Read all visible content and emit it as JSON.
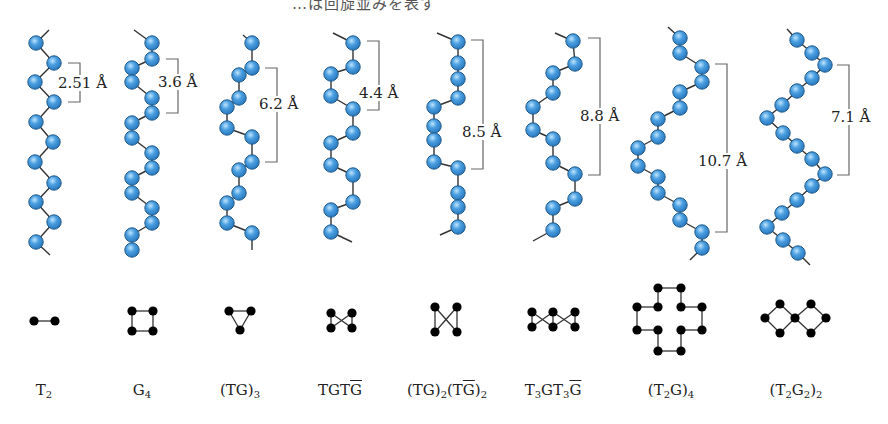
{
  "header": {
    "caption_fragment": "…は回旋並みを表す"
  },
  "colors": {
    "atom_fill": "#4a9fe0",
    "atom_stroke": "#1f5a8a",
    "bond": "#333333",
    "projection": "#000000",
    "bracket": "#666666"
  },
  "chains": [
    {
      "id": "T2",
      "label_html": "T<sub>2</sub>",
      "label_x": 44,
      "repeat_distance": "2.51 Å",
      "atoms": [
        [
          36,
          43
        ],
        [
          54,
          63
        ],
        [
          35,
          82
        ],
        [
          54,
          102
        ],
        [
          36,
          122
        ],
        [
          53,
          142
        ],
        [
          35,
          162
        ],
        [
          54,
          183
        ],
        [
          36,
          202
        ],
        [
          54,
          222
        ],
        [
          36,
          242
        ]
      ],
      "ends": [
        [
          49,
          30
        ],
        [
          50,
          255
        ]
      ],
      "bracket": {
        "x": 80,
        "y1": 63,
        "y2": 102,
        "label_x": 57,
        "label_y": 75
      },
      "projection": {
        "nodes": [
          [
            34,
            321
          ],
          [
            55,
            321
          ]
        ],
        "edges": [
          [
            0,
            1
          ]
        ]
      }
    },
    {
      "id": "G4",
      "label_html": "G<sub>4</sub>",
      "label_x": 142,
      "repeat_distance": "3.6 Å",
      "atoms": [
        [
          152,
          43
        ],
        [
          152,
          59
        ],
        [
          132,
          68
        ],
        [
          132,
          82
        ],
        [
          152,
          98
        ],
        [
          152,
          113
        ],
        [
          132,
          123
        ],
        [
          132,
          138
        ],
        [
          152,
          153
        ],
        [
          152,
          168
        ],
        [
          132,
          178
        ],
        [
          132,
          193
        ],
        [
          152,
          208
        ],
        [
          152,
          223
        ],
        [
          132,
          235
        ],
        [
          132,
          250
        ]
      ],
      "ends": [
        [
          134,
          30
        ],
        null
      ],
      "bracket": {
        "x": 178,
        "y1": 59,
        "y2": 113,
        "label_x": 157,
        "label_y": 74
      },
      "projection": {
        "nodes": [
          [
            132,
            311
          ],
          [
            153,
            311
          ],
          [
            132,
            331
          ],
          [
            153,
            331
          ]
        ],
        "edges": [
          [
            0,
            1
          ],
          [
            1,
            3
          ],
          [
            3,
            2
          ],
          [
            2,
            0
          ]
        ]
      }
    },
    {
      "id": "(TG)3",
      "label_html": "(TG)<sub>3</sub>",
      "label_x": 240,
      "repeat_distance": "6.2 Å",
      "atoms": [
        [
          252,
          43
        ],
        [
          252,
          68
        ],
        [
          239,
          75
        ],
        [
          239,
          98
        ],
        [
          227,
          107
        ],
        [
          227,
          128
        ],
        [
          252,
          137
        ],
        [
          252,
          162
        ],
        [
          239,
          170
        ],
        [
          239,
          193
        ],
        [
          227,
          203
        ],
        [
          227,
          223
        ],
        [
          252,
          233
        ]
      ],
      "ends": [
        [
          243,
          35
        ],
        [
          252,
          250
        ]
      ],
      "bracket": {
        "x": 277,
        "y1": 68,
        "y2": 162,
        "label_x": 258,
        "label_y": 96
      },
      "projection": {
        "nodes": [
          [
            229,
            311
          ],
          [
            251,
            311
          ],
          [
            240,
            330
          ]
        ],
        "edges": [
          [
            0,
            1
          ],
          [
            1,
            2
          ],
          [
            2,
            0
          ]
        ]
      }
    },
    {
      "id": "TGTG-bar",
      "label_html": "TGT<span class=\"ov\">G</span>",
      "label_x": 340,
      "repeat_distance": "4.4 Å",
      "atoms": [
        [
          353,
          43
        ],
        [
          353,
          67
        ],
        [
          331,
          74
        ],
        [
          331,
          96
        ],
        [
          353,
          109
        ],
        [
          353,
          133
        ],
        [
          331,
          143
        ],
        [
          331,
          165
        ],
        [
          353,
          175
        ],
        [
          353,
          202
        ],
        [
          331,
          210
        ],
        [
          331,
          232
        ]
      ],
      "ends": [
        [
          333,
          33
        ],
        [
          352,
          242
        ]
      ],
      "bracket": {
        "x": 379,
        "y1": 41,
        "y2": 110,
        "label_x": 358,
        "label_y": 85
      },
      "projection": {
        "nodes": [
          [
            331,
            313
          ],
          [
            352,
            313
          ],
          [
            331,
            328
          ],
          [
            352,
            328
          ]
        ],
        "edges": [
          [
            0,
            3
          ],
          [
            1,
            2
          ],
          [
            0,
            2
          ],
          [
            1,
            3
          ]
        ]
      }
    },
    {
      "id": "(TG)2(TG-bar)2",
      "label_html": "(TG)<sub>2</sub>(T<span class=\"ov\">G</span>)<sub>2</sub>",
      "label_x": 447,
      "repeat_distance": "8.5 Å",
      "atoms": [
        [
          458,
          42
        ],
        [
          458,
          63
        ],
        [
          458,
          79
        ],
        [
          458,
          98
        ],
        [
          434,
          107
        ],
        [
          434,
          126
        ],
        [
          434,
          140
        ],
        [
          434,
          162
        ],
        [
          458,
          168
        ],
        [
          458,
          193
        ],
        [
          458,
          207
        ],
        [
          458,
          227
        ]
      ],
      "ends": [
        [
          437,
          33
        ],
        [
          440,
          235
        ]
      ],
      "bracket": {
        "x": 483,
        "y1": 40,
        "y2": 169,
        "label_x": 461,
        "label_y": 124
      },
      "projection": {
        "nodes": [
          [
            435,
            307
          ],
          [
            457,
            307
          ],
          [
            435,
            332
          ],
          [
            457,
            332
          ]
        ],
        "edges": [
          [
            0,
            2
          ],
          [
            1,
            3
          ],
          [
            0,
            3
          ],
          [
            1,
            2
          ]
        ]
      }
    },
    {
      "id": "T3GT3G-bar",
      "label_html": "T<sub>3</sub>GT<sub>3</sub><span class=\"ov\">G</span>",
      "label_x": 553,
      "repeat_distance": "8.8 Å",
      "atoms": [
        [
          573,
          41
        ],
        [
          575,
          64
        ],
        [
          553,
          73
        ],
        [
          553,
          93
        ],
        [
          533,
          107
        ],
        [
          533,
          130
        ],
        [
          553,
          139
        ],
        [
          553,
          163
        ],
        [
          575,
          174
        ],
        [
          575,
          199
        ],
        [
          553,
          208
        ],
        [
          553,
          230
        ]
      ],
      "ends": [
        [
          555,
          33
        ],
        [
          533,
          241
        ]
      ],
      "bracket": {
        "x": 600,
        "y1": 38,
        "y2": 175,
        "label_x": 579,
        "label_y": 108
      },
      "projection": {
        "nodes": [
          [
            532,
            312
          ],
          [
            553,
            312
          ],
          [
            575,
            312
          ],
          [
            532,
            327
          ],
          [
            553,
            327
          ],
          [
            575,
            327
          ]
        ],
        "edges": [
          [
            0,
            3
          ],
          [
            1,
            4
          ],
          [
            2,
            5
          ],
          [
            0,
            4
          ],
          [
            3,
            1
          ],
          [
            1,
            5
          ],
          [
            4,
            2
          ]
        ]
      }
    },
    {
      "id": "(T2G)4",
      "label_html": "(T<sub>2</sub>G)<sub>4</sub>",
      "label_x": 671,
      "repeat_distance": "10.7 Å",
      "atoms": [
        [
          680,
          38
        ],
        [
          680,
          53
        ],
        [
          702,
          67
        ],
        [
          702,
          82
        ],
        [
          680,
          92
        ],
        [
          680,
          108
        ],
        [
          658,
          119
        ],
        [
          658,
          137
        ],
        [
          638,
          148
        ],
        [
          638,
          166
        ],
        [
          658,
          177
        ],
        [
          658,
          193
        ],
        [
          680,
          205
        ],
        [
          680,
          220
        ],
        [
          702,
          232
        ],
        [
          702,
          248
        ]
      ],
      "ends": [
        [
          668,
          27
        ],
        [
          690,
          260
        ]
      ],
      "bracket": {
        "x": 727,
        "y1": 64,
        "y2": 232,
        "label_x": 697,
        "label_y": 153
      },
      "projection": {
        "nodes": [
          [
            658,
            288
          ],
          [
            681,
            288
          ],
          [
            637,
            307
          ],
          [
            658,
            307
          ],
          [
            681,
            307
          ],
          [
            702,
            307
          ],
          [
            637,
            330
          ],
          [
            658,
            330
          ],
          [
            681,
            330
          ],
          [
            702,
            330
          ],
          [
            658,
            351
          ],
          [
            681,
            351
          ]
        ],
        "edges": [
          [
            0,
            1
          ],
          [
            0,
            3
          ],
          [
            1,
            4
          ],
          [
            3,
            2
          ],
          [
            4,
            5
          ],
          [
            2,
            6
          ],
          [
            5,
            9
          ],
          [
            6,
            7
          ],
          [
            8,
            9
          ],
          [
            7,
            10
          ],
          [
            8,
            11
          ],
          [
            10,
            11
          ]
        ]
      }
    },
    {
      "id": "(T2G2)2",
      "label_html": "(T<sub>2</sub>G<sub>2</sub>)<sub>2</sub>",
      "label_x": 796,
      "repeat_distance": "7.1 Å",
      "atoms": [
        [
          797,
          40
        ],
        [
          812,
          53
        ],
        [
          825,
          65
        ],
        [
          812,
          78
        ],
        [
          797,
          91
        ],
        [
          782,
          105
        ],
        [
          767,
          118
        ],
        [
          783,
          133
        ],
        [
          797,
          146
        ],
        [
          812,
          159
        ],
        [
          825,
          174
        ],
        [
          812,
          186
        ],
        [
          797,
          200
        ],
        [
          782,
          213
        ],
        [
          767,
          227
        ],
        [
          783,
          240
        ],
        [
          798,
          253
        ]
      ],
      "ends": [
        [
          787,
          29
        ],
        [
          810,
          265
        ]
      ],
      "bracket": {
        "x": 849,
        "y1": 65,
        "y2": 175,
        "label_x": 830,
        "label_y": 109
      },
      "projection": {
        "nodes": [
          [
            765,
            318
          ],
          [
            780,
            304
          ],
          [
            780,
            333
          ],
          [
            795,
            318
          ],
          [
            811,
            304
          ],
          [
            811,
            333
          ],
          [
            826,
            318
          ]
        ],
        "edges": [
          [
            0,
            1
          ],
          [
            0,
            2
          ],
          [
            1,
            3
          ],
          [
            2,
            3
          ],
          [
            3,
            4
          ],
          [
            3,
            5
          ],
          [
            4,
            6
          ],
          [
            5,
            6
          ]
        ]
      }
    }
  ],
  "labels_text": [
    "T2",
    "G4",
    "(TG)3",
    "TGTḠ",
    "(TG)2(TḠ)2",
    "T3GT3Ḡ",
    "(T2G)4",
    "(T2G2)2"
  ]
}
